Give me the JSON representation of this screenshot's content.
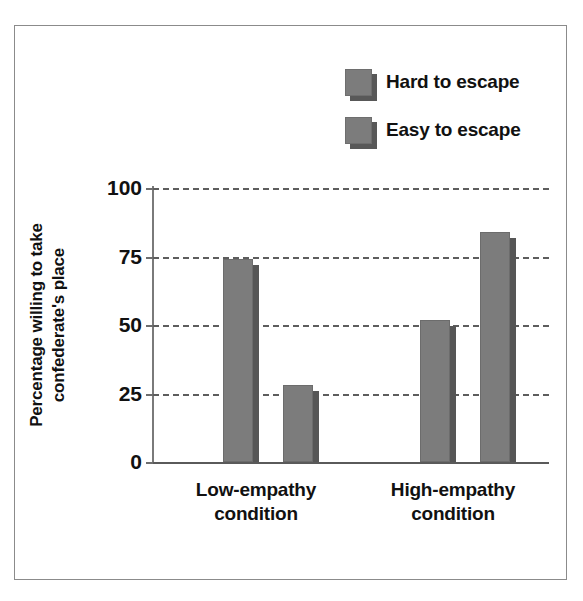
{
  "chart_data": {
    "type": "bar",
    "title": "",
    "xlabel": "",
    "ylabel": "Percentage willing to take confederate's place",
    "ylabel_lines": [
      "Percentage willing to take",
      "confederate's place"
    ],
    "categories": [
      "Low-empathy condition",
      "High-empathy condition"
    ],
    "category_lines": [
      [
        "Low-empathy",
        "condition"
      ],
      [
        "High-empathy",
        "condition"
      ]
    ],
    "series": [
      {
        "name": "Hard to escape",
        "values": [
          74,
          52
        ]
      },
      {
        "name": "Easy to escape",
        "values": [
          28,
          84
        ]
      }
    ],
    "ylim": [
      0,
      100
    ],
    "yticks": [
      0,
      25,
      50,
      75,
      100
    ],
    "ytick_labels": [
      "0",
      "25",
      "50",
      "75",
      "100"
    ],
    "grid": "horizontal-dashed",
    "legend_position": "top-right",
    "colors": {
      "bar_face": "#7c7c7c",
      "bar_shadow": "#565656",
      "gridline": "#5d5d5d",
      "axis": "#7a7a7a",
      "text": "#111111",
      "frame": "#8b8b8b",
      "background": "#ffffff"
    }
  },
  "legend": {
    "items": [
      {
        "label": "Hard to escape",
        "swatch": "gray-square-shadow"
      },
      {
        "label": "Easy to escape",
        "swatch": "gray-square-shadow"
      }
    ]
  },
  "axis": {
    "y_labels": [
      "100",
      "75",
      "50",
      "25",
      "0"
    ],
    "y_title_line1": "Percentage willing to take",
    "y_title_line2": "confederate's place"
  },
  "x_axis": {
    "groups": [
      {
        "line1": "Low-empathy",
        "line2": "condition"
      },
      {
        "line1": "High-empathy",
        "line2": "condition"
      }
    ]
  }
}
